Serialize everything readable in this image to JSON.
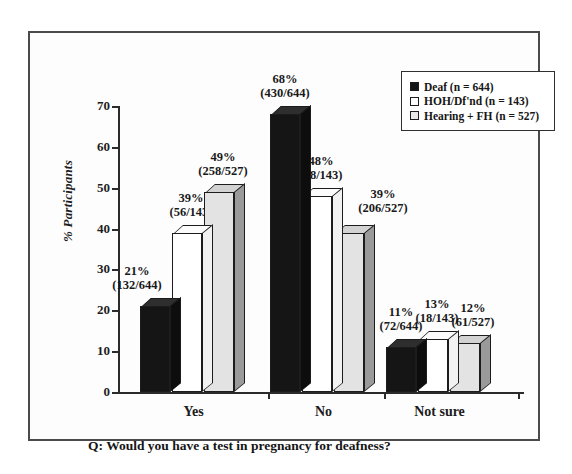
{
  "figure": {
    "caption": "Q: Would you have a test in pregnancy for deafness?"
  },
  "chart_data": {
    "type": "bar",
    "title": "",
    "subtitle": "",
    "xlabel": "",
    "ylabel": "% Participants",
    "ylim": [
      0,
      70
    ],
    "yticks": [
      "0",
      "10",
      "20",
      "30",
      "40",
      "50",
      "60",
      "70"
    ],
    "grid": false,
    "legend_position": "top-right",
    "style": "3d-grouped-bar",
    "categories": [
      "Yes",
      "No",
      "Not sure"
    ],
    "series": [
      {
        "name": "Deaf (n = 644)",
        "short_name": "Deaf",
        "n": 644,
        "color": "#151515",
        "values": [
          21,
          68,
          11
        ],
        "labels": [
          "21%",
          "68%",
          "11%"
        ],
        "fractions": [
          "(132/644)",
          "(430/644)",
          "(72/644)"
        ],
        "numerators": [
          132,
          430,
          72
        ]
      },
      {
        "name": "HOH/Df'nd (n = 143)",
        "short_name": "HOH/Df'nd",
        "n": 143,
        "color": "#ffffff",
        "values": [
          39,
          48,
          13
        ],
        "labels": [
          "39%",
          "48%",
          "13%"
        ],
        "fractions": [
          "(56/143)",
          "(68/143)",
          "(18/143)"
        ],
        "numerators": [
          56,
          68,
          18
        ]
      },
      {
        "name": "Hearing + FH (n = 527)",
        "short_name": "Hearing + FH",
        "n": 527,
        "color": "#e3e3e3",
        "values": [
          49,
          39,
          12
        ],
        "labels": [
          "49%",
          "39%",
          "12%"
        ],
        "fractions": [
          "(258/527)",
          "(206/527)",
          "(61/527)"
        ],
        "numerators": [
          258,
          206,
          61
        ]
      }
    ]
  },
  "legend": {
    "items": [
      {
        "label": "Deaf (n = 644)",
        "name": "Deaf",
        "n": "644"
      },
      {
        "label": "HOH/Df'nd (n = 143)",
        "name": "HOH/Df'nd",
        "n": "143"
      },
      {
        "label": "Hearing + FH (n = 527)",
        "name": "Hearing + FH",
        "n": "527"
      }
    ]
  }
}
